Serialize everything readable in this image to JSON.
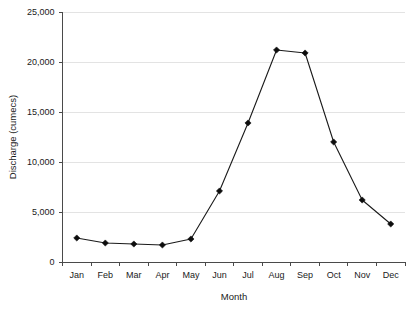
{
  "chart_data": {
    "type": "line",
    "title": "",
    "xlabel": "Month",
    "ylabel": "Discharge (cumecs)",
    "categories": [
      "Jan",
      "Feb",
      "Mar",
      "Apr",
      "May",
      "Jun",
      "Jul",
      "Aug",
      "Sep",
      "Oct",
      "Nov",
      "Dec"
    ],
    "values": [
      2400,
      1900,
      1800,
      1700,
      2300,
      7100,
      13900,
      21200,
      20900,
      12000,
      6200,
      3800
    ],
    "series": [
      {
        "name": "Discharge",
        "values": [
          2400,
          1900,
          1800,
          1700,
          2300,
          7100,
          13900,
          21200,
          20900,
          12000,
          6200,
          3800
        ]
      }
    ],
    "ylim": [
      0,
      25000
    ],
    "ytick_values": [
      0,
      5000,
      10000,
      15000,
      20000,
      25000
    ],
    "ytick_labels": [
      "0",
      "5,000",
      "10,000",
      "15,000",
      "20,000",
      "25,000"
    ],
    "xtick_labels": [
      "Jan",
      "Feb",
      "Mar",
      "Apr",
      "May",
      "Jun",
      "Jul",
      "Aug",
      "Sep",
      "Oct",
      "Nov",
      "Dec"
    ],
    "grid": true,
    "grid_axis": "y",
    "legend": false,
    "legend_position": "none",
    "marker": "diamond",
    "line_color": "#1a1a1a",
    "marker_color": "#0d0d0d",
    "grid_color": "#e3e3e3",
    "axis_color": "#4a4a4a",
    "background_color": "#ffffff"
  },
  "axes": {
    "y_title": "Discharge (cumecs)",
    "x_title": "Month"
  }
}
